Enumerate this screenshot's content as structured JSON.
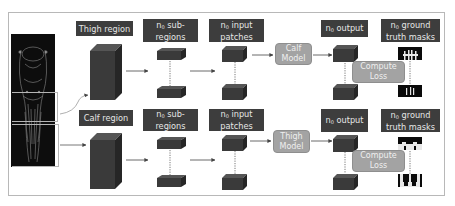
{
  "diagram": {
    "rows": [
      {
        "region_label": "Thigh region",
        "subregions_label_prefix": "n",
        "subregions_label_sub": "0",
        "subregions_label_rest": " sub-regions",
        "patches_label_prefix": "n",
        "patches_label_sub": "0",
        "patches_label_rest": " input patches",
        "model_label": "Calf Model",
        "output_label_prefix": "n",
        "output_label_sub": "0",
        "output_label_rest": " output",
        "masks_label_prefix": "n",
        "masks_label_sub": "0",
        "masks_label_rest": " ground truth masks",
        "loss_label": "Compute Loss"
      },
      {
        "region_label": "Calf region",
        "subregions_label_prefix": "n",
        "subregions_label_sub": "0",
        "subregions_label_rest": " sub-regions",
        "patches_label_prefix": "n",
        "patches_label_sub": "0",
        "patches_label_rest": " input patches",
        "model_label": "Thigh Model",
        "output_label_prefix": "n",
        "output_label_sub": "0",
        "output_label_rest": " output",
        "masks_label_prefix": "n",
        "masks_label_sub": "0",
        "masks_label_rest": " ground truth masks",
        "loss_label": "Compute Loss"
      }
    ],
    "input_image": "whole-body-mri-scan",
    "colors": {
      "label_bg": "#3d3d3d",
      "label_text": "#e6e6e6",
      "model_bg": "#a3a3a3",
      "cube_front": "#3a3a3a",
      "cube_top": "#555555",
      "cube_side": "#2a2a2a",
      "arrow": "#444444",
      "frame": "#b8b8b8"
    }
  }
}
